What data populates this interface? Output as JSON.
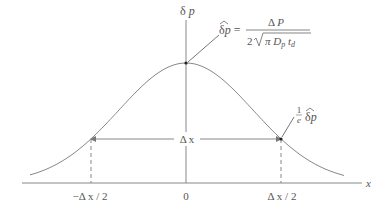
{
  "figure": {
    "y_axis_label": "δ p",
    "x_axis_label": "x",
    "peak_annotation": {
      "lhs": "δp̂ =",
      "numerator": "Δ P",
      "denominator": "2√(π Dp td)"
    },
    "width_annotation": {
      "fraction": "1/e",
      "value": "δp̂"
    },
    "width_label": "Δ x",
    "ticks": [
      "−Δ x / 2",
      "0",
      "Δ x / 2"
    ],
    "curve": "gaussian",
    "colors": {
      "line": "#888888",
      "text": "#555555"
    }
  }
}
